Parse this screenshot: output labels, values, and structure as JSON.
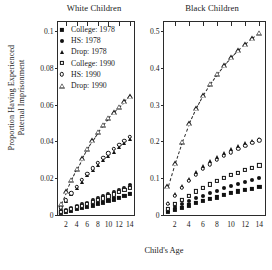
{
  "figure": {
    "xlabel": "Child's Age",
    "ylabel_line1": "Proportion Having Experienced",
    "ylabel_line2": "Paternal Imprisonment"
  },
  "legend": {
    "items": [
      {
        "label": "College: 1978",
        "marker": "filled-square"
      },
      {
        "label": "HS: 1978",
        "marker": "filled-circle"
      },
      {
        "label": "Drop: 1978",
        "marker": "filled-triangle"
      },
      {
        "label": "College: 1990",
        "marker": "open-square"
      },
      {
        "label": "HS: 1990",
        "marker": "open-circle"
      },
      {
        "label": "Drop: 1990",
        "marker": "open-triangle"
      }
    ]
  },
  "chart_data": [
    {
      "type": "scatter",
      "title": "White Children",
      "xlabel": "Child's Age",
      "ylabel": "Proportion Having Experienced Paternal Imprisonment",
      "xlim": [
        0.5,
        14.8
      ],
      "ylim": [
        0,
        0.105
      ],
      "xticks": [
        2,
        4,
        6,
        8,
        10,
        12,
        14
      ],
      "yticks": [
        0,
        0.02,
        0.04,
        0.06,
        0.08,
        0.1
      ],
      "ytick_labels": [
        "0",
        "0.02",
        "0.04",
        "0.06",
        "0.08",
        "0.1"
      ],
      "grid": false,
      "legend_position": "top-left",
      "x": [
        1,
        2,
        3,
        4,
        5,
        6,
        7,
        8,
        9,
        10,
        11,
        12,
        13,
        14
      ],
      "series": [
        {
          "name": "College: 1978",
          "marker": "filled-square",
          "values": [
            0.0012,
            0.0018,
            0.0025,
            0.0031,
            0.0038,
            0.0045,
            0.0052,
            0.006,
            0.0068,
            0.0076,
            0.0085,
            0.0094,
            0.0104,
            0.0115
          ]
        },
        {
          "name": "HS: 1978",
          "marker": "filled-circle",
          "values": [
            0.0018,
            0.0028,
            0.0038,
            0.0048,
            0.0058,
            0.0068,
            0.0079,
            0.009,
            0.0101,
            0.0112,
            0.0124,
            0.0136,
            0.0149,
            0.0162
          ]
        },
        {
          "name": "Drop: 1978",
          "marker": "filled-triangle",
          "values": [
            0.004,
            0.0075,
            0.0112,
            0.0148,
            0.0182,
            0.0215,
            0.0245,
            0.0272,
            0.0298,
            0.0322,
            0.0345,
            0.0368,
            0.039,
            0.0412
          ]
        },
        {
          "name": "College: 1990",
          "marker": "open-square",
          "values": [
            0.0016,
            0.0024,
            0.0033,
            0.0042,
            0.0051,
            0.006,
            0.007,
            0.008,
            0.009,
            0.0101,
            0.0112,
            0.0124,
            0.0136,
            0.0149
          ]
        },
        {
          "name": "HS: 1990",
          "marker": "open-circle",
          "values": [
            0.0042,
            0.008,
            0.0118,
            0.0155,
            0.019,
            0.0223,
            0.0254,
            0.0283,
            0.031,
            0.0335,
            0.0359,
            0.0382,
            0.0404,
            0.0426
          ]
        },
        {
          "name": "Drop: 1990",
          "marker": "open-triangle",
          "values": [
            0.0062,
            0.0128,
            0.0192,
            0.0252,
            0.0308,
            0.036,
            0.0408,
            0.0452,
            0.0492,
            0.0528,
            0.056,
            0.059,
            0.0618,
            0.0645
          ]
        }
      ]
    },
    {
      "type": "scatter",
      "title": "Black Children",
      "xlabel": "Child's Age",
      "ylabel": "Proportion Having Experienced Paternal Imprisonment",
      "xlim": [
        0.5,
        14.8
      ],
      "ylim": [
        0,
        0.525
      ],
      "xticks": [
        2,
        4,
        6,
        8,
        10,
        12,
        14
      ],
      "yticks": [
        0,
        0.1,
        0.2,
        0.3,
        0.4,
        0.5
      ],
      "ytick_labels": [
        "0",
        "0.1",
        "0.2",
        "0.3",
        "0.4",
        "0.5"
      ],
      "grid": false,
      "legend_position": "none",
      "x": [
        1,
        2,
        3,
        4,
        5,
        6,
        7,
        8,
        9,
        10,
        11,
        12,
        13,
        14
      ],
      "series": [
        {
          "name": "College: 1978",
          "marker": "filled-square",
          "values": [
            0.008,
            0.014,
            0.02,
            0.026,
            0.032,
            0.038,
            0.043,
            0.048,
            0.054,
            0.059,
            0.064,
            0.068,
            0.072,
            0.076
          ]
        },
        {
          "name": "HS: 1978",
          "marker": "filled-circle",
          "values": [
            0.012,
            0.021,
            0.029,
            0.037,
            0.045,
            0.052,
            0.059,
            0.066,
            0.073,
            0.079,
            0.085,
            0.091,
            0.096,
            0.101
          ]
        },
        {
          "name": "Drop: 1978",
          "marker": "filled-triangle",
          "values": [
            0.032,
            0.056,
            0.078,
            0.098,
            0.116,
            0.132,
            0.146,
            0.158,
            0.169,
            0.179,
            0.188,
            0.195,
            0.201,
            0.207
          ]
        },
        {
          "name": "College: 1990",
          "marker": "open-square",
          "values": [
            0.017,
            0.03,
            0.042,
            0.053,
            0.064,
            0.074,
            0.083,
            0.092,
            0.1,
            0.108,
            0.115,
            0.122,
            0.129,
            0.135
          ]
        },
        {
          "name": "HS: 1990",
          "marker": "open-circle",
          "values": [
            0.03,
            0.053,
            0.074,
            0.093,
            0.11,
            0.125,
            0.138,
            0.15,
            0.161,
            0.171,
            0.18,
            0.188,
            0.196,
            0.203
          ]
        },
        {
          "name": "Drop: 1990",
          "marker": "open-triangle",
          "values": [
            0.078,
            0.141,
            0.199,
            0.249,
            0.29,
            0.326,
            0.357,
            0.384,
            0.408,
            0.429,
            0.448,
            0.465,
            0.481,
            0.496
          ]
        }
      ]
    }
  ]
}
